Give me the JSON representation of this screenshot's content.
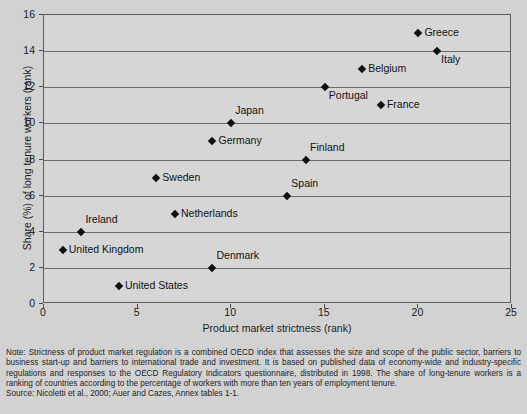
{
  "chart_data": {
    "type": "scatter",
    "title": "",
    "xlabel": "Product market strictness (rank)",
    "ylabel": "Share (%) of long tenure workers (rank)",
    "xlim": [
      0,
      25
    ],
    "ylim": [
      0,
      16
    ],
    "xticks": [
      0,
      5,
      10,
      15,
      20,
      25
    ],
    "yticks": [
      0,
      2,
      4,
      6,
      8,
      10,
      12,
      14,
      16
    ],
    "grid": "horizontal",
    "legend": "none",
    "points": [
      {
        "label": "Greece",
        "x": 20,
        "y": 15,
        "label_pos": "right"
      },
      {
        "label": "Italy",
        "x": 21,
        "y": 14,
        "label_pos": "below"
      },
      {
        "label": "Belgium",
        "x": 17,
        "y": 13,
        "label_pos": "right"
      },
      {
        "label": "Portugal",
        "x": 15,
        "y": 12,
        "label_pos": "below"
      },
      {
        "label": "France",
        "x": 18,
        "y": 11,
        "label_pos": "right"
      },
      {
        "label": "Japan",
        "x": 10,
        "y": 10,
        "label_pos": "above"
      },
      {
        "label": "Germany",
        "x": 9,
        "y": 9,
        "label_pos": "right"
      },
      {
        "label": "Finland",
        "x": 14,
        "y": 8,
        "label_pos": "above"
      },
      {
        "label": "Sweden",
        "x": 6,
        "y": 7,
        "label_pos": "right"
      },
      {
        "label": "Spain",
        "x": 13,
        "y": 6,
        "label_pos": "above"
      },
      {
        "label": "Netherlands",
        "x": 7,
        "y": 5,
        "label_pos": "right"
      },
      {
        "label": "Ireland",
        "x": 2,
        "y": 4,
        "label_pos": "above"
      },
      {
        "label": "United Kingdom",
        "x": 1,
        "y": 3,
        "label_pos": "right"
      },
      {
        "label": "Denmark",
        "x": 9,
        "y": 2,
        "label_pos": "above"
      },
      {
        "label": "United States",
        "x": 4,
        "y": 1,
        "label_pos": "right"
      }
    ]
  },
  "footnote": {
    "note": "Note: Strictness of product market regulation is a combined OECD index that assesses the size and scope of the public sector, barriers to business start-up and barriers to international trade and investment. It is based on published data of economy-wide and industry-specific regulations and responses to the OECD Regulatory Indicators questionnaire, distributed in 1998. The share of long-tenure workers is a ranking of countries according to the percentage of workers with more than ten years of employment tenure.",
    "source": "Source: Nicoletti et al., 2000; Auer and Cazes, Annex tables 1-1."
  }
}
